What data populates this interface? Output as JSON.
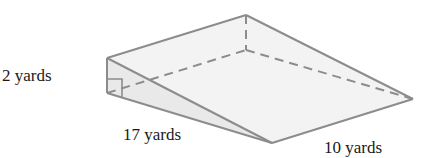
{
  "figure": {
    "type": "triangular-prism",
    "labels": {
      "height": "2 yards",
      "length": "17 yards",
      "width": "10 yards"
    },
    "colors": {
      "edge": "#8c8c8c",
      "face": "#f2f2f2",
      "text": "#1a1a1a"
    }
  }
}
